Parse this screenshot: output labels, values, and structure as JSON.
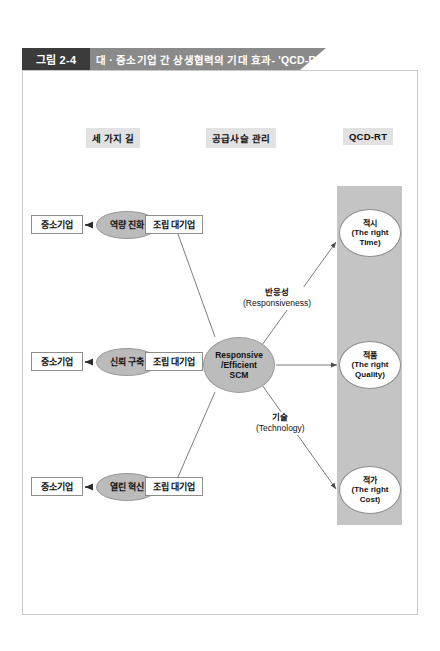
{
  "figure": {
    "number": "그림 2-4",
    "title": "대 · 중소기업 간 상생협력의 기대 효과- 'QCD-RT'"
  },
  "columns": {
    "left_heading": "세 가지 길",
    "middle_heading": "공급사슬 관리",
    "right_heading": "QCD-RT"
  },
  "paths": [
    {
      "sme": "중소기업",
      "mechanism": "역량 진화",
      "corp": "조립 대기업"
    },
    {
      "sme": "중소기업",
      "mechanism": "신뢰 구축",
      "corp": "조립 대기업"
    },
    {
      "sme": "중소기업",
      "mechanism": "열린 혁신",
      "corp": "조립 대기업"
    }
  ],
  "scm": {
    "line1": "Responsive",
    "line2": "/Efficient",
    "line3": "SCM"
  },
  "edge_labels": {
    "responsiveness_kr": "반응성",
    "responsiveness_en": "(Responsiveness)",
    "technology_kr": "기술",
    "technology_en": "(Technology)"
  },
  "outcomes": [
    {
      "kr": "적시",
      "en_line1": "(The right",
      "en_line2": "Time)"
    },
    {
      "kr": "적품",
      "en_line1": "(The right",
      "en_line2": "Quality)"
    },
    {
      "kr": "적가",
      "en_line1": "(The right",
      "en_line2": "Cost)"
    }
  ],
  "colors": {
    "banner_dark": "#3b3b3b",
    "banner_gray": "#8a8a8a",
    "band_gray": "#c4c4c4",
    "ellipse_gray": "#bbbbbb",
    "heading_bg": "#e2e2e2",
    "frame_border": "#c9c9c9",
    "node_border": "#8d8d8d"
  }
}
